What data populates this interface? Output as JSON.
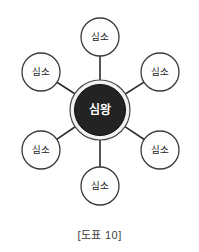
{
  "figure": {
    "caption": "[도표 10]",
    "hub": {
      "label": "심왕",
      "cx": 100,
      "cy": 110,
      "ring_radius": 30,
      "core_radius": 25.5,
      "core_color": "#232323",
      "ring_color": "#f2f2f2",
      "label_color": "#ffffff"
    },
    "satellites": [
      {
        "label": "심소",
        "cx": 100,
        "cy": 37,
        "r": 19,
        "name": "top"
      },
      {
        "label": "심소",
        "cx": 160,
        "cy": 72,
        "r": 19,
        "name": "upper-right"
      },
      {
        "label": "심소",
        "cx": 160,
        "cy": 150,
        "r": 19,
        "name": "lower-right"
      },
      {
        "label": "심소",
        "cx": 100,
        "cy": 186,
        "r": 19,
        "name": "bottom"
      },
      {
        "label": "심소",
        "cx": 41,
        "cy": 150,
        "r": 19,
        "name": "lower-left"
      },
      {
        "label": "심소",
        "cx": 41,
        "cy": 72,
        "r": 19,
        "name": "upper-left"
      }
    ],
    "colors": {
      "background": "#ffffff",
      "line": "#2b2b2b",
      "satellite_fill": "#fdfdfd",
      "satellite_stroke": "#3a3a3a",
      "caption_text": "#3d3d3d"
    }
  }
}
